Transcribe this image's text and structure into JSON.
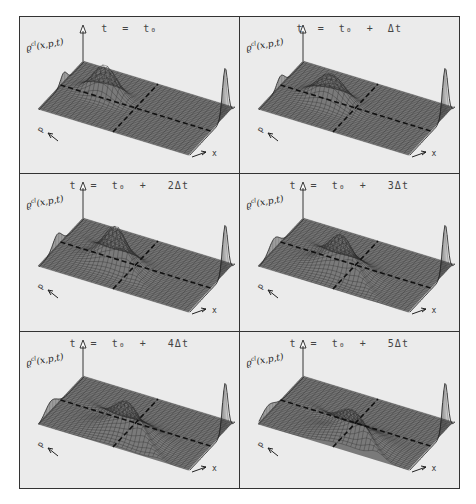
{
  "figure": {
    "panels": [
      {
        "title": "t  =  t₀",
        "step": 0
      },
      {
        "title": "t  =  t₀  +  Δt",
        "step": 1
      },
      {
        "title": "t  =  t₀  +   2Δt",
        "step": 2
      },
      {
        "title": "t  =  t₀  +   3Δt",
        "step": 3
      },
      {
        "title": "t  =  t₀  +   4Δt",
        "step": 4
      },
      {
        "title": "t  =  t₀  +   5Δt",
        "step": 5
      }
    ],
    "z_axis_label_base": "ϱ",
    "z_axis_label_sup": "cl",
    "z_axis_label_args": "(x,p,t)",
    "x_axis_label": "x",
    "p_axis_label": "p",
    "colors": {
      "panel_bg": "#ebebeb",
      "frame": "#333333",
      "mesh": "#2a2a2a"
    }
  }
}
